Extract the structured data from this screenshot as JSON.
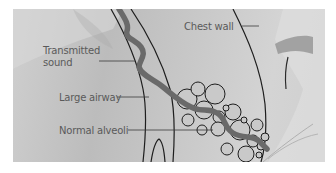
{
  "figure": {
    "labels": {
      "transmitted_sound_line1": "Transmitted",
      "transmitted_sound_line2": "sound",
      "chest_wall": "Chest wall",
      "large_airway": "Large airway",
      "normal_alveoli": "Normal alveoli"
    },
    "colors": {
      "background_border": "#ffffff",
      "photo_gray": "#c6c6c6",
      "outline": "#1e1e1e",
      "sound_wave": "#6a6a6a",
      "alveoli_fill": "#c9c9c9",
      "label_text": "#5a5a5a"
    }
  }
}
